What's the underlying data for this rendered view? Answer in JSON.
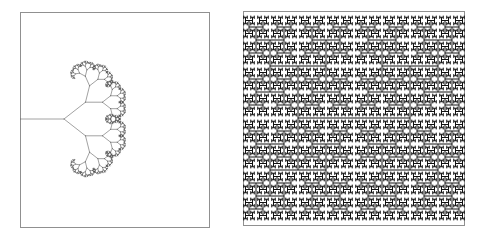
{
  "figure": {
    "title": "",
    "background_color": "#ffffff",
    "panel_count": 2
  },
  "panels": [
    {
      "id": "binary-tree-fractal",
      "name": "left-panel",
      "label": "",
      "x": 20,
      "y": 12,
      "width": 190,
      "height": 216,
      "border": true,
      "border_color": "#808080",
      "border_width": 1,
      "fill_color": "#ffffff",
      "stroke_color": "#555555",
      "stroke_width": 0.55,
      "fractal": {
        "type": "binary-branching-tree",
        "direction": "left-to-right",
        "depth": 9,
        "root_x": 0,
        "root_y": 107,
        "root_length": 44,
        "length_ratio": 0.62,
        "branch_angle_deg": 38,
        "angle_decay": 1.0
      }
    },
    {
      "id": "h-tree-fractal",
      "name": "right-panel",
      "label": "",
      "x": 243,
      "y": 11,
      "width": 222,
      "height": 215,
      "border": true,
      "border_color": "#808080",
      "border_width": 1,
      "fill_color": "#ffffff",
      "stroke_color": "#101010",
      "stroke_width": 1.0,
      "fractal": {
        "type": "h-tree",
        "depth": 6,
        "center_x": 111,
        "center_y": 107,
        "initial_half_width": 56,
        "initial_half_height": 52,
        "scale_ratio": 0.5
      }
    }
  ],
  "chart_data": {
    "type": "line",
    "title": "",
    "xlabel": "",
    "ylabel": "",
    "grid": false,
    "legend": "none",
    "series": [
      {
        "name": "binary-branching-tree",
        "description": "Recursive binary tree, branches spawn rightward at +/- 38 degrees, each child 0.62x parent length, 9 levels of recursion",
        "values": [
          1,
          2,
          4,
          8,
          16,
          32,
          64,
          128,
          256
        ]
      },
      {
        "name": "h-tree",
        "description": "Recursive H-tree (Vicsek-like) fractal, each H spawns 4 half-scale H shapes at its corners, 6 levels of recursion",
        "values": [
          1,
          4,
          16,
          64,
          256,
          1024
        ]
      }
    ]
  }
}
